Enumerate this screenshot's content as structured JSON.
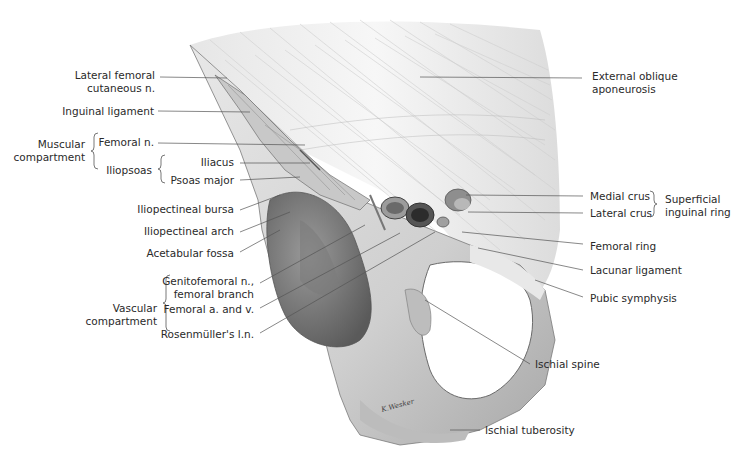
{
  "figure": {
    "artist_signature": "signature"
  },
  "labels_left": {
    "lateral_femoral_cutaneous_1": "Lateral femoral",
    "lateral_femoral_cutaneous_2": "cutaneous n.",
    "inguinal_ligament": "Inguinal ligament",
    "muscular_compartment_1": "Muscular",
    "muscular_compartment_2": "compartment",
    "femoral_n": "Femoral n.",
    "iliopsoas": "Iliopsoas",
    "iliacus": "Iliacus",
    "psoas_major": "Psoas major",
    "iliopectineal_bursa": "Iliopectineal bursa",
    "iliopectineal_arch": "Iliopectineal arch",
    "acetabular_fossa": "Acetabular fossa",
    "genitofemoral_1": "Genitofemoral n.,",
    "genitofemoral_2": "femoral branch",
    "vascular_compartment_1": "Vascular",
    "vascular_compartment_2": "compartment",
    "femoral_av": "Femoral a. and v.",
    "rosenmuller": "Rosenmüller's l.n."
  },
  "labels_right": {
    "external_oblique_1": "External oblique",
    "external_oblique_2": "aponeurosis",
    "medial_crus": "Medial crus",
    "lateral_crus": "Lateral crus",
    "superficial_ring_1": "Superficial",
    "superficial_ring_2": "inguinal ring",
    "femoral_ring": "Femoral ring",
    "lacunar_ligament": "Lacunar ligament",
    "pubic_symphysis": "Pubic symphysis",
    "ischial_spine": "Ischial spine",
    "ischial_tuberosity": "Ischial tuberosity"
  },
  "colors": {
    "bone": "#d9d9d9",
    "bone_shadow": "#8c8c8c",
    "aponeurosis": "#f2f2f2",
    "leader_line": "#555555",
    "text": "#2a2a2a"
  }
}
